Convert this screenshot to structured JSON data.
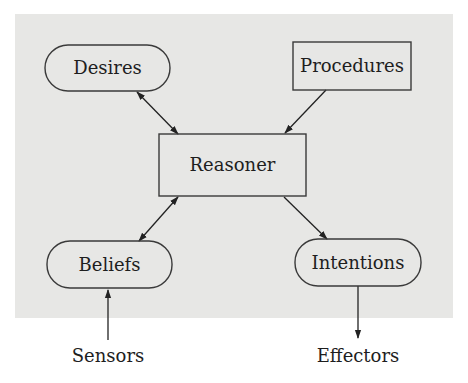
{
  "diagram": {
    "title": "",
    "colors": {
      "background_panel": "#e7e7e5",
      "stroke": "#3a3a3a",
      "text": "#1e1e1e"
    },
    "nodes": [
      {
        "id": "desires",
        "label": "Desires",
        "shape": "rounded-pill"
      },
      {
        "id": "procedures",
        "label": "Procedures",
        "shape": "rectangle"
      },
      {
        "id": "reasoner",
        "label": "Reasoner",
        "shape": "rectangle"
      },
      {
        "id": "beliefs",
        "label": "Beliefs",
        "shape": "rounded-pill"
      },
      {
        "id": "intentions",
        "label": "Intentions",
        "shape": "rounded-pill"
      }
    ],
    "external": [
      {
        "id": "sensors",
        "label": "Sensors"
      },
      {
        "id": "effectors",
        "label": "Effectors"
      }
    ],
    "edges": [
      {
        "from": "desires",
        "to": "reasoner",
        "direction": "both"
      },
      {
        "from": "procedures",
        "to": "reasoner",
        "direction": "forward"
      },
      {
        "from": "reasoner",
        "to": "beliefs",
        "direction": "both"
      },
      {
        "from": "reasoner",
        "to": "intentions",
        "direction": "forward"
      },
      {
        "from": "sensors",
        "to": "beliefs",
        "direction": "forward"
      },
      {
        "from": "intentions",
        "to": "effectors",
        "direction": "forward"
      }
    ]
  }
}
